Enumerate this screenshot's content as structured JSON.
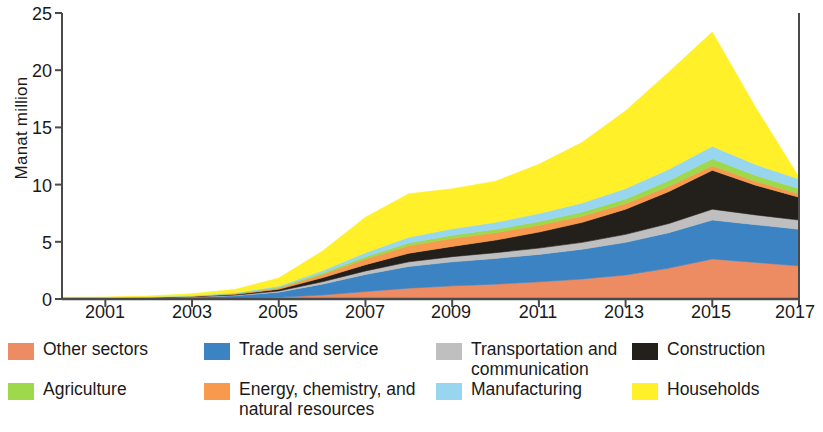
{
  "chart_data": {
    "type": "area",
    "stacked": true,
    "title": "",
    "xlabel": "",
    "ylabel": "Manat million",
    "ylim": [
      0,
      25
    ],
    "yticks": [
      0,
      5,
      10,
      15,
      20,
      25
    ],
    "ytick_labels": [
      "0",
      "5",
      "10",
      "15",
      "20",
      "25"
    ],
    "xlim": [
      2000,
      2017
    ],
    "xticks": [
      2001,
      2003,
      2005,
      2007,
      2009,
      2011,
      2013,
      2015,
      2017
    ],
    "xtick_labels": [
      "2001",
      "2003",
      "2005",
      "2007",
      "2009",
      "2011",
      "2013",
      "2015",
      "2017"
    ],
    "grid": false,
    "legend_position": "bottom",
    "x": [
      2000,
      2001,
      2002,
      2003,
      2004,
      2005,
      2006,
      2007,
      2008,
      2009,
      2010,
      2011,
      2012,
      2013,
      2014,
      2015,
      2016,
      2017
    ],
    "series": [
      {
        "name": "Other sectors",
        "color": "#ED8B62",
        "values": [
          0.02,
          0.03,
          0.04,
          0.06,
          0.09,
          0.15,
          0.35,
          0.65,
          0.95,
          1.15,
          1.3,
          1.5,
          1.75,
          2.1,
          2.7,
          3.5,
          3.2,
          2.9
        ]
      },
      {
        "name": "Trade and service",
        "color": "#3C83C4",
        "values": [
          0.03,
          0.04,
          0.06,
          0.1,
          0.2,
          0.45,
          0.95,
          1.5,
          1.9,
          2.1,
          2.25,
          2.4,
          2.6,
          2.85,
          3.1,
          3.4,
          3.3,
          3.2
        ]
      },
      {
        "name": "Transportation and communication",
        "color": "#BFBFBF",
        "values": [
          0.01,
          0.01,
          0.02,
          0.03,
          0.05,
          0.1,
          0.2,
          0.3,
          0.4,
          0.45,
          0.5,
          0.55,
          0.6,
          0.7,
          0.8,
          0.95,
          0.85,
          0.8
        ]
      },
      {
        "name": "Construction",
        "color": "#231F1B",
        "values": [
          0.01,
          0.01,
          0.02,
          0.04,
          0.07,
          0.15,
          0.35,
          0.55,
          0.75,
          0.9,
          1.1,
          1.4,
          1.75,
          2.2,
          2.8,
          3.4,
          2.6,
          2.0
        ]
      },
      {
        "name": "Energy, chemistry, and natural resources",
        "color": "#F79A4E",
        "values": [
          0.01,
          0.01,
          0.02,
          0.03,
          0.06,
          0.12,
          0.3,
          0.5,
          0.65,
          0.7,
          0.65,
          0.6,
          0.55,
          0.5,
          0.45,
          0.4,
          0.35,
          0.3
        ]
      },
      {
        "name": "Agriculture",
        "color": "#9ED84B",
        "values": [
          0.01,
          0.01,
          0.01,
          0.02,
          0.03,
          0.06,
          0.12,
          0.2,
          0.25,
          0.28,
          0.3,
          0.32,
          0.35,
          0.4,
          0.5,
          0.6,
          0.5,
          0.45
        ]
      },
      {
        "name": "Manufacturing",
        "color": "#98D5EE",
        "values": [
          0.01,
          0.01,
          0.02,
          0.03,
          0.05,
          0.1,
          0.2,
          0.35,
          0.5,
          0.55,
          0.6,
          0.7,
          0.8,
          0.9,
          1.0,
          1.1,
          0.95,
          0.85
        ]
      },
      {
        "name": "Households",
        "color": "#FFF02A",
        "values": [
          0.05,
          0.06,
          0.08,
          0.15,
          0.3,
          0.7,
          1.7,
          3.1,
          3.8,
          3.5,
          3.6,
          4.3,
          5.3,
          6.8,
          8.5,
          10.0,
          5.0,
          0.15
        ]
      }
    ],
    "totals": [
      0.15,
      0.18,
      0.27,
      0.46,
      0.85,
      1.83,
      4.17,
      7.15,
      9.2,
      9.63,
      10.3,
      11.77,
      13.7,
      16.45,
      19.85,
      23.35,
      16.75,
      10.65
    ]
  },
  "legend": {
    "items": [
      {
        "label": "Other sectors",
        "color": "#ED8B62"
      },
      {
        "label": "Trade and service",
        "color": "#3C83C4"
      },
      {
        "label": "Transportation and communication",
        "color": "#BFBFBF"
      },
      {
        "label": "Construction",
        "color": "#231F1B"
      },
      {
        "label": "Agriculture",
        "color": "#9ED84B"
      },
      {
        "label": "Energy, chemistry, and natural resources",
        "color": "#F79A4E"
      },
      {
        "label": "Manufacturing",
        "color": "#98D5EE"
      },
      {
        "label": "Households",
        "color": "#FFF02A"
      }
    ]
  },
  "axes": {
    "y_label": "Manat million",
    "y_tick_0": "0",
    "y_tick_1": "5",
    "y_tick_2": "10",
    "y_tick_3": "15",
    "y_tick_4": "20",
    "y_tick_5": "25",
    "x_tick_0": "2001",
    "x_tick_1": "2003",
    "x_tick_2": "2005",
    "x_tick_3": "2007",
    "x_tick_4": "2009",
    "x_tick_5": "2011",
    "x_tick_6": "2013",
    "x_tick_7": "2015",
    "x_tick_8": "2017"
  }
}
